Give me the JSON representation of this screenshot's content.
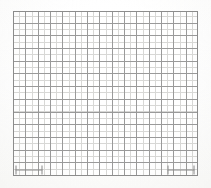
{
  "document": {
    "title": "Graph paper grid sheet",
    "kind": "blank-grid-chart",
    "has_text": false,
    "has_plotted_data": false
  },
  "colors": {
    "page_background": "#ffffff",
    "plate_background": "#ffffff",
    "major_line": "#9a9a9a",
    "minor_line": "#d8d8d6",
    "border_line": "#8d8d8d",
    "scale_bar": "#8a8a8a",
    "paper_tone": "#fbfbfa"
  },
  "grid": {
    "left": 13,
    "top": 11,
    "width": 185,
    "height": 165,
    "major_cell_width": 12.33,
    "major_cell_height": 12.7,
    "major_columns": 15,
    "major_rows": 13,
    "minor_divisions_per_major": 2,
    "minor_cell_width": 6.17,
    "minor_cell_height": 6.35,
    "major_line_width": 1,
    "minor_line_width": 1,
    "grid_enabled": true
  },
  "annotations": {
    "bottom_left_scale_bar": {
      "name": "scale-bar",
      "x": 15,
      "y": 165,
      "width": 28,
      "height": 10,
      "orientation": "horizontal"
    },
    "bottom_right_scale_bar": {
      "name": "scale-bar",
      "x": 167,
      "y": 165,
      "width": 28,
      "height": 10,
      "orientation": "horizontal"
    }
  },
  "chart_data": {
    "type": "table",
    "title": "",
    "subtitle": "",
    "xlabel": "",
    "ylabel": "",
    "categories": [],
    "values": [],
    "series": [],
    "tick_labels": {
      "x": [],
      "y": []
    },
    "legend": {
      "entries": [],
      "position": "none"
    },
    "xlim": [
      0,
      15
    ],
    "ylim": [
      0,
      13
    ],
    "grid": true
  }
}
